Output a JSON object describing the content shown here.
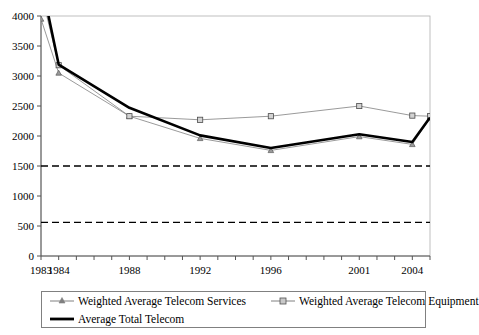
{
  "chart_data": {
    "type": "line",
    "title": "",
    "xlabel": "",
    "ylabel": "",
    "xlim": [
      1983,
      2005
    ],
    "ylim": [
      0,
      4000
    ],
    "grid": false,
    "legend_position": "bottom",
    "y_ticks": [
      0,
      500,
      1000,
      1500,
      2000,
      2500,
      3000,
      3500,
      4000
    ],
    "y_tick_labels": [
      "0",
      "500",
      "1000",
      "1500",
      "2000",
      "2500",
      "3000",
      "3500",
      "4000"
    ],
    "x_ticks": [
      1983,
      1984,
      1985,
      1986,
      1987,
      1988,
      1989,
      1990,
      1991,
      1992,
      1993,
      1994,
      1995,
      1996,
      1997,
      1998,
      1999,
      2000,
      2001,
      2002,
      2003,
      2004,
      2005
    ],
    "x_tick_labels": [
      {
        "year": 1983,
        "label": "1983"
      },
      {
        "year": 1984,
        "label": "1984"
      },
      {
        "year": 1988,
        "label": "1988"
      },
      {
        "year": 1992,
        "label": "1992"
      },
      {
        "year": 1996,
        "label": "1996"
      },
      {
        "year": 2001,
        "label": "2001"
      },
      {
        "year": 2004,
        "label": "2004"
      }
    ],
    "reference_lines": [
      {
        "name": "upper-reference",
        "value": 1500,
        "style": "dashed",
        "color": "#000000"
      },
      {
        "name": "lower-reference",
        "value": 560,
        "style": "dashed",
        "color": "#000000"
      }
    ],
    "series": [
      {
        "name": "Weighted Average Telecom Services",
        "marker": "triangle",
        "color": "#808080",
        "line_width": 0.8,
        "x": [
          1983,
          1984,
          1988,
          1992,
          1996,
          2001,
          2004,
          2005
        ],
        "values": [
          3950,
          3050,
          2330,
          1960,
          1760,
          1990,
          1860,
          2300
        ]
      },
      {
        "name": "Weighted Average Telecom Equipment",
        "marker": "square",
        "color": "#808080",
        "line_width": 0.8,
        "x": [
          1983,
          1984,
          1988,
          1992,
          1996,
          2001,
          2004,
          2005
        ],
        "values": [
          4400,
          3180,
          2330,
          2270,
          2330,
          2500,
          2340,
          2330
        ]
      },
      {
        "name": "Average Total Telecom",
        "marker": "none",
        "color": "#000000",
        "line_width": 2.6,
        "x": [
          1983,
          1984,
          1988,
          1992,
          1996,
          2001,
          2004,
          2005
        ],
        "values": [
          4600,
          3190,
          2470,
          2010,
          1800,
          2030,
          1900,
          2310
        ]
      }
    ]
  },
  "legend": {
    "entries": [
      {
        "label": "Weighted Average Telecom Services",
        "symbol": "line-triangle"
      },
      {
        "label": "Weighted Average Telecom Equipment",
        "symbol": "line-square"
      },
      {
        "label": "Average Total Telecom",
        "symbol": "thick-line"
      }
    ]
  }
}
